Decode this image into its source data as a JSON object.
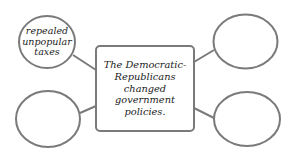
{
  "diagram": {
    "type": "web-organizer",
    "stroke_color": "#7a7a7a",
    "center": {
      "lines": [
        "The Democratic-",
        "Republicans",
        "changed",
        "government",
        "policies."
      ]
    },
    "nodes": [
      {
        "position": "top-left",
        "lines": [
          "repealed",
          "unpopular",
          "taxes"
        ]
      },
      {
        "position": "top-right",
        "lines": []
      },
      {
        "position": "bottom-left",
        "lines": []
      },
      {
        "position": "bottom-right",
        "lines": []
      }
    ]
  }
}
